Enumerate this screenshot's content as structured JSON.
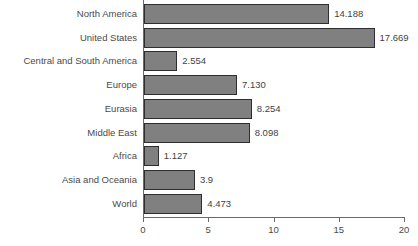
{
  "chart_data": {
    "type": "bar",
    "orientation": "horizontal",
    "title": "",
    "subtitle": "",
    "xlabel": "",
    "ylabel": "",
    "xlim": [
      0,
      20
    ],
    "xticks": [
      0,
      5,
      10,
      15,
      20
    ],
    "xtick_labels": [
      "0",
      "5",
      "10",
      "15",
      "20"
    ],
    "grid": false,
    "legend": null,
    "categories": [
      "North America",
      "United States",
      "Central and South America",
      "Europe",
      "Eurasia",
      "Middle East",
      "Africa",
      "Asia and Oceania",
      "World"
    ],
    "values": [
      14.188,
      17.669,
      2.554,
      7.13,
      8.254,
      8.098,
      1.127,
      3.9,
      4.473
    ],
    "value_labels": [
      "14.188",
      "17.669",
      "2.554",
      "7.130",
      "8.254",
      "8.098",
      "1.127",
      "3.9",
      "4.473"
    ],
    "colors": {
      "bar_fill": "#808080",
      "bar_border": "#2e2e2e",
      "axis": "#6a6a6a",
      "text": "#3f3f3f",
      "background": "#ffffff"
    }
  }
}
